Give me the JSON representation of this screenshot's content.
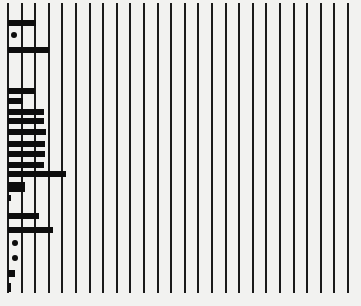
{
  "figure": {
    "background": "#f2f2f0",
    "ink": "#0d0d0d",
    "rule_color": "#1a1a1a",
    "rules": {
      "x_positions": [
        8,
        22,
        35,
        49,
        62,
        76,
        90,
        103,
        117,
        130,
        144,
        158,
        171,
        185,
        198,
        212,
        226,
        239,
        253,
        266,
        280,
        294,
        307,
        321,
        334,
        348
      ],
      "top": 3,
      "bottom": 293
    },
    "bars": [
      {
        "y": 20,
        "h": 6,
        "x": 8,
        "x_end": 36
      },
      {
        "y": 47,
        "h": 6,
        "x": 8,
        "x_end": 49
      },
      {
        "y": 88,
        "h": 6,
        "x": 8,
        "x_end": 35
      },
      {
        "y": 98,
        "h": 6,
        "x": 8,
        "x_end": 23
      },
      {
        "y": 109,
        "h": 6,
        "x": 8,
        "x_end": 44
      },
      {
        "y": 118,
        "h": 6,
        "x": 8,
        "x_end": 44
      },
      {
        "y": 129,
        "h": 6,
        "x": 8,
        "x_end": 46
      },
      {
        "y": 141,
        "h": 6,
        "x": 8,
        "x_end": 45
      },
      {
        "y": 151,
        "h": 6,
        "x": 8,
        "x_end": 45
      },
      {
        "y": 162,
        "h": 6,
        "x": 8,
        "x_end": 44
      },
      {
        "y": 171,
        "h": 6,
        "x": 8,
        "x_end": 66
      },
      {
        "y": 182,
        "h": 6,
        "x": 8,
        "x_end": 25
      },
      {
        "y": 187,
        "h": 5,
        "x": 8,
        "x_end": 25
      },
      {
        "y": 195,
        "h": 6,
        "x": 8,
        "x_end": 11
      },
      {
        "y": 213,
        "h": 6,
        "x": 8,
        "x_end": 39
      },
      {
        "y": 227,
        "h": 6,
        "x": 8,
        "x_end": 53
      },
      {
        "y": 270,
        "h": 7,
        "x": 8,
        "x_end": 15
      },
      {
        "y": 283,
        "h": 9,
        "x": 8,
        "x_end": 11
      }
    ],
    "dots": [
      {
        "x": 14,
        "y": 35
      },
      {
        "x": 15,
        "y": 243
      },
      {
        "x": 15,
        "y": 258
      }
    ]
  }
}
